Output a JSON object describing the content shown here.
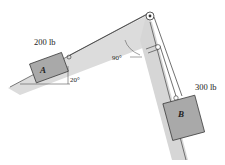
{
  "diagram": {
    "type": "statics-pulley-problem",
    "block_a": {
      "label": "A",
      "weight_label": "200 lb"
    },
    "block_b": {
      "label": "B",
      "weight_label": "300 lb"
    },
    "angles": {
      "incline": "20°",
      "apex": "90°"
    },
    "colors": {
      "block_fill": "#a9a9a9",
      "surface_fill": "#d9d9d9",
      "line": "#333333",
      "background": "#ffffff"
    },
    "icons": {
      "main_pulley": "pulley-icon",
      "secondary_pulley": "pulley-icon",
      "block_a_hook": "hook-icon",
      "block_b_hook": "hook-icon"
    }
  }
}
